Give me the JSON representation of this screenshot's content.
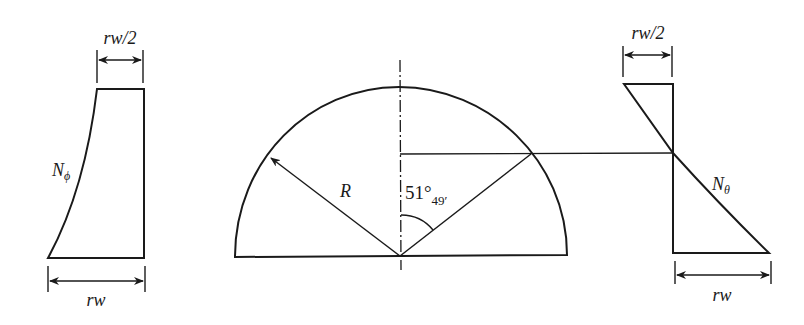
{
  "diagram": {
    "title": "",
    "left_plot": {
      "name": "meridional force distribution",
      "curve_label": "N",
      "curve_subscript": "ϕ",
      "top_dimension": "rw/2",
      "bottom_dimension": "rw"
    },
    "center_plot": {
      "name": "hemispherical dome section",
      "radius_label": "R",
      "angle_degrees": "51°",
      "angle_minutes": "49′"
    },
    "right_plot": {
      "name": "hoop force distribution",
      "curve_label": "N",
      "curve_subscript": "θ",
      "top_dimension": "rw/2",
      "bottom_dimension": "rw"
    },
    "colors": {
      "line": "#1a1a1a",
      "background": "#ffffff"
    }
  }
}
